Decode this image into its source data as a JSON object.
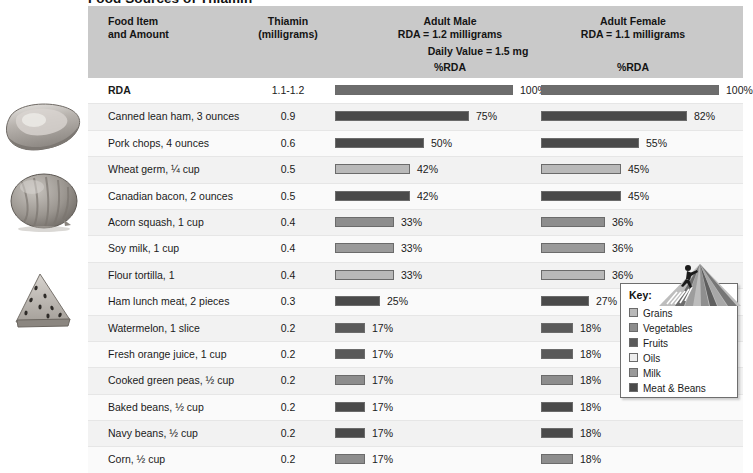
{
  "title": "Food Sources of Thiamin",
  "header": {
    "col_food": "Food Item\nand Amount",
    "col_food_l1": "Food Item",
    "col_food_l2": "and Amount",
    "col_nutrient_l1": "Thiamin",
    "col_nutrient_l2": "(milligrams)",
    "male_l1": "Adult Male",
    "male_l2": "RDA = 1.2 milligrams",
    "female_l1": "Adult Female",
    "female_l2": "RDA = 1.1 milligrams",
    "daily_value": "Daily Value = 1.5 mg",
    "pct_rda_male": "%RDA",
    "pct_rda_female": "%RDA"
  },
  "legend": {
    "title": "Key:",
    "items": [
      {
        "label": "Grains",
        "color": "#b9b9b9"
      },
      {
        "label": "Vegetables",
        "color": "#8d8d8d"
      },
      {
        "label": "Fruits",
        "color": "#5a5a5a"
      },
      {
        "label": "Oils",
        "color": "#eeeeee"
      },
      {
        "label": "Milk",
        "color": "#9a9a9a"
      },
      {
        "label": "Meat & Beans",
        "color": "#4a4a4a"
      }
    ]
  },
  "photos": [
    {
      "name": "pork-chop"
    },
    {
      "name": "acorn-squash"
    },
    {
      "name": "watermelon-slice"
    }
  ],
  "chart_data": {
    "type": "bar",
    "title": "Food Sources of Thiamin",
    "xlabel": "%RDA",
    "ylabel": "Food Item and Amount",
    "xlim": [
      0,
      100
    ],
    "grid": false,
    "legend_position": "bottom-right",
    "categories": [
      "RDA",
      "Canned lean ham, 3 ounces",
      "Pork chops, 4 ounces",
      "Wheat germ, ¼ cup",
      "Canadian bacon, 2 ounces",
      "Acorn squash, 1 cup",
      "Soy milk, 1 cup",
      "Flour tortilla, 1",
      "Ham lunch meat, 2 pieces",
      "Watermelon, 1 slice",
      "Fresh orange juice, 1 cup",
      "Cooked green peas, ½ cup",
      "Baked beans, ½ cup",
      "Navy beans, ½ cup",
      "Corn, ½ cup"
    ],
    "amounts": [
      "1.1-1.2",
      "0.9",
      "0.6",
      "0.5",
      "0.5",
      "0.4",
      "0.4",
      "0.4",
      "0.3",
      "0.2",
      "0.2",
      "0.2",
      "0.2",
      "0.2",
      "0.2"
    ],
    "series": [
      {
        "name": "Adult Male RDA (1.2 mg)",
        "values": [
          100,
          75,
          50,
          42,
          42,
          33,
          33,
          33,
          25,
          17,
          17,
          17,
          17,
          17,
          17
        ]
      },
      {
        "name": "Adult Female RDA (1.1 mg)",
        "values": [
          100,
          82,
          55,
          45,
          45,
          36,
          36,
          36,
          27,
          18,
          18,
          18,
          18,
          18,
          18
        ]
      }
    ],
    "food_groups": [
      "Meat & Beans",
      "Meat & Beans",
      "Meat & Beans",
      "Grains",
      "Meat & Beans",
      "Vegetables",
      "Milk",
      "Grains",
      "Meat & Beans",
      "Fruits",
      "Fruits",
      "Vegetables",
      "Meat & Beans",
      "Meat & Beans",
      "Vegetables"
    ]
  },
  "rows": [
    {
      "food": "RDA",
      "amount": "1.1-1.2",
      "male": 100,
      "male_label": "100%",
      "female": 100,
      "female_label": "100%",
      "color": "#6d6d6d"
    },
    {
      "food": "Canned lean ham, 3 ounces",
      "amount": "0.9",
      "male": 75,
      "male_label": "75%",
      "female": 82,
      "female_label": "82%",
      "color": "#4a4a4a"
    },
    {
      "food": "Pork chops, 4 ounces",
      "amount": "0.6",
      "male": 50,
      "male_label": "50%",
      "female": 55,
      "female_label": "55%",
      "color": "#4a4a4a"
    },
    {
      "food": "Wheat germ, ¼ cup",
      "amount": "0.5",
      "male": 42,
      "male_label": "42%",
      "female": 45,
      "female_label": "45%",
      "color": "#b9b9b9"
    },
    {
      "food": "Canadian bacon, 2 ounces",
      "amount": "0.5",
      "male": 42,
      "male_label": "42%",
      "female": 45,
      "female_label": "45%",
      "color": "#4a4a4a"
    },
    {
      "food": "Acorn squash, 1 cup",
      "amount": "0.4",
      "male": 33,
      "male_label": "33%",
      "female": 36,
      "female_label": "36%",
      "color": "#8d8d8d"
    },
    {
      "food": "Soy milk, 1 cup",
      "amount": "0.4",
      "male": 33,
      "male_label": "33%",
      "female": 36,
      "female_label": "36%",
      "color": "#9a9a9a"
    },
    {
      "food": "Flour tortilla, 1",
      "amount": "0.4",
      "male": 33,
      "male_label": "33%",
      "female": 36,
      "female_label": "36%",
      "color": "#b9b9b9"
    },
    {
      "food": "Ham lunch meat, 2 pieces",
      "amount": "0.3",
      "male": 25,
      "male_label": "25%",
      "female": 27,
      "female_label": "27%",
      "color": "#4a4a4a"
    },
    {
      "food": "Watermelon, 1 slice",
      "amount": "0.2",
      "male": 17,
      "male_label": "17%",
      "female": 18,
      "female_label": "18%",
      "color": "#5a5a5a"
    },
    {
      "food": "Fresh orange juice, 1 cup",
      "amount": "0.2",
      "male": 17,
      "male_label": "17%",
      "female": 18,
      "female_label": "18%",
      "color": "#5a5a5a"
    },
    {
      "food": "Cooked green peas, ½ cup",
      "amount": "0.2",
      "male": 17,
      "male_label": "17%",
      "female": 18,
      "female_label": "18%",
      "color": "#8d8d8d"
    },
    {
      "food": "Baked beans, ½ cup",
      "amount": "0.2",
      "male": 17,
      "male_label": "17%",
      "female": 18,
      "female_label": "18%",
      "color": "#4a4a4a"
    },
    {
      "food": "Navy beans, ½ cup",
      "amount": "0.2",
      "male": 17,
      "male_label": "17%",
      "female": 18,
      "female_label": "18%",
      "color": "#4a4a4a"
    },
    {
      "food": "Corn, ½ cup",
      "amount": "0.2",
      "male": 17,
      "male_label": "17%",
      "female": 18,
      "female_label": "18%",
      "color": "#8d8d8d"
    }
  ]
}
